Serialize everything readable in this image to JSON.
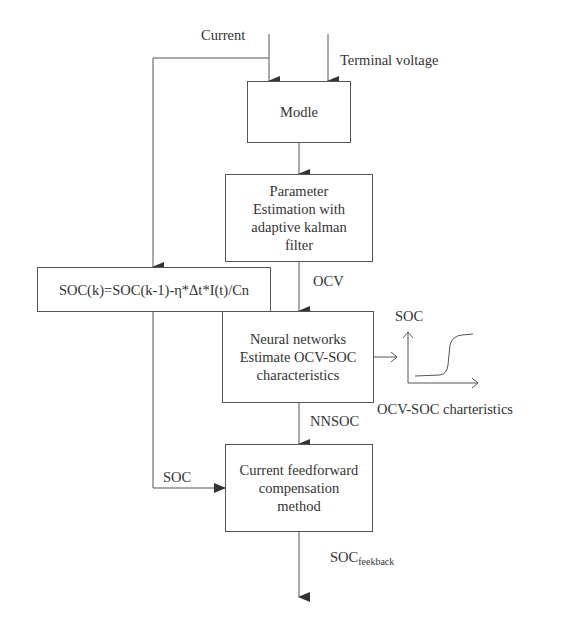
{
  "diagram": {
    "inputs": {
      "current": "Current",
      "terminal_voltage": "Terminal voltage"
    },
    "boxes": {
      "model": {
        "lines": [
          "Modle"
        ]
      },
      "parameter_estimation": {
        "lines": [
          "Parameter",
          "Estimation with",
          "adaptive kalman",
          "filter"
        ]
      },
      "soc_formula": {
        "lines": [
          "SOC(k)=SOC(k-1)-η*Δt*I(t)/Cn"
        ]
      },
      "neural_networks": {
        "lines": [
          "Neural networks",
          "Estimate OCV-SOC",
          "characteristics"
        ]
      },
      "compensation": {
        "lines": [
          "Current feedforward",
          "compensation",
          "method"
        ]
      }
    },
    "edge_labels": {
      "ocv": "OCV",
      "nnsoc": "NNSOC",
      "soc": "SOC",
      "output_main": "SOC",
      "output_sub": "feekback"
    },
    "mini_chart": {
      "y_label": "SOC",
      "caption": "OCV-SOC charteristics"
    },
    "colors": {
      "line": "#555555",
      "text": "#333333",
      "background": "#ffffff"
    }
  }
}
